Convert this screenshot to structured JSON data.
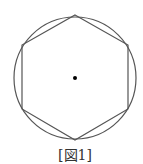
{
  "figure": {
    "caption": "[図1]",
    "circle": {
      "cx": 75,
      "cy": 78,
      "r": 61
    },
    "hexagon": [
      [
        75,
        15
      ],
      [
        128,
        45
      ],
      [
        128,
        109
      ],
      [
        75,
        140
      ],
      [
        22,
        109
      ],
      [
        22,
        45
      ]
    ],
    "center_dot": {
      "cx": 75,
      "cy": 78,
      "r": 2
    },
    "stroke_color": "#555555"
  }
}
